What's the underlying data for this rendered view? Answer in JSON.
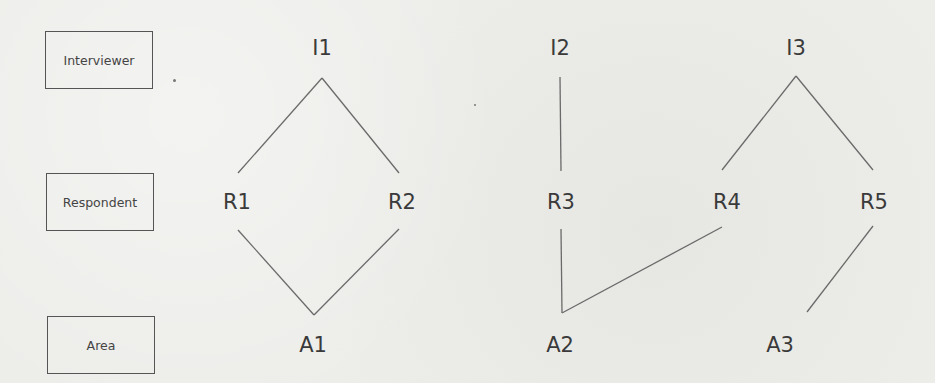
{
  "legend": {
    "levels": [
      {
        "id": "interviewer",
        "label": "Interviewer"
      },
      {
        "id": "respondent",
        "label": "Respondent"
      },
      {
        "id": "area",
        "label": "Area"
      }
    ]
  },
  "nodes": {
    "interviewers": [
      "I1",
      "I2",
      "I3"
    ],
    "respondents": [
      "R1",
      "R2",
      "R3",
      "R4",
      "R5"
    ],
    "areas": [
      "A1",
      "A2",
      "A3"
    ]
  },
  "edges": [
    {
      "from": "I1",
      "to": "R1"
    },
    {
      "from": "I1",
      "to": "R2"
    },
    {
      "from": "I2",
      "to": "R3"
    },
    {
      "from": "I3",
      "to": "R4"
    },
    {
      "from": "I3",
      "to": "R5"
    },
    {
      "from": "R1",
      "to": "A1"
    },
    {
      "from": "R2",
      "to": "A1"
    },
    {
      "from": "R3",
      "to": "A2"
    },
    {
      "from": "R4",
      "to": "A2"
    },
    {
      "from": "R5",
      "to": "A3"
    }
  ],
  "colors": {
    "background": "#ededea",
    "line": "#6a6a6a",
    "text": "#3a3a3a",
    "box_border": "#555555"
  }
}
